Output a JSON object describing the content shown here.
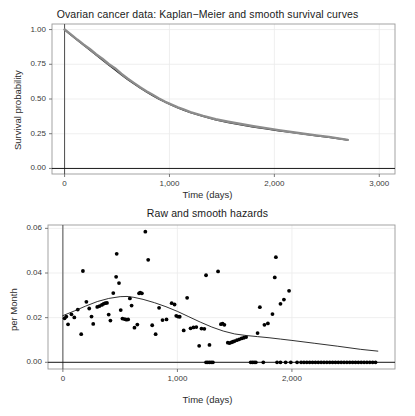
{
  "figure": {
    "width": 415,
    "height": 416,
    "background": "#ffffff",
    "panel_background": "#ffffff",
    "grid_color": "#ebebeb",
    "axis_color": "#4d4d4d",
    "point_color": "#000000",
    "smooth_curve_color": "#1a1a1a",
    "km_curve_color": "#8c8c8c"
  },
  "chart_data": [
    {
      "id": "survival",
      "type": "line",
      "title": "Ovarian cancer data: Kaplan−Meier and smooth survival curves",
      "xlabel": "Time (days)",
      "ylabel": "Survival probability",
      "xlim": [
        -120,
        3150
      ],
      "ylim": [
        -0.04,
        1.04
      ],
      "xticks": [
        0,
        1000,
        2000,
        3000
      ],
      "xticklabels": [
        "0",
        "1,000",
        "2,000",
        "3,000"
      ],
      "yticks": [
        0.0,
        0.25,
        0.5,
        0.75,
        1.0
      ],
      "yticklabels": [
        "0.00",
        "0.25",
        "0.50",
        "0.75",
        "1.00"
      ],
      "grid": true,
      "legend": "none",
      "series": [
        {
          "name": "Smooth survival curve",
          "style": "solid-dark",
          "x": [
            0,
            60,
            120,
            180,
            240,
            300,
            360,
            420,
            480,
            540,
            600,
            660,
            720,
            780,
            840,
            900,
            960,
            1020,
            1080,
            1140,
            1200,
            1320,
            1440,
            1560,
            1680,
            1800,
            1920,
            2040,
            2160,
            2280,
            2400,
            2520,
            2700
          ],
          "y": [
            1.0,
            0.962,
            0.925,
            0.889,
            0.854,
            0.818,
            0.782,
            0.746,
            0.711,
            0.676,
            0.642,
            0.61,
            0.58,
            0.552,
            0.525,
            0.5,
            0.477,
            0.456,
            0.437,
            0.419,
            0.403,
            0.375,
            0.351,
            0.331,
            0.314,
            0.299,
            0.285,
            0.272,
            0.26,
            0.248,
            0.236,
            0.225,
            0.205
          ]
        },
        {
          "name": "Kaplan−Meier step curve",
          "style": "solid-grey",
          "x": [
            0,
            60,
            120,
            180,
            240,
            300,
            360,
            420,
            480,
            540,
            600,
            660,
            720,
            780,
            840,
            900,
            960,
            1020,
            1080,
            1140,
            1200,
            1320,
            1440,
            1560,
            1680,
            1800,
            1920,
            2040,
            2160,
            2280,
            2400,
            2520,
            2700
          ],
          "y": [
            1.0,
            0.965,
            0.928,
            0.893,
            0.86,
            0.822,
            0.79,
            0.752,
            0.722,
            0.682,
            0.648,
            0.616,
            0.584,
            0.556,
            0.53,
            0.504,
            0.48,
            0.46,
            0.44,
            0.423,
            0.406,
            0.378,
            0.354,
            0.336,
            0.32,
            0.304,
            0.29,
            0.276,
            0.262,
            0.25,
            0.238,
            0.227,
            0.206
          ]
        }
      ]
    },
    {
      "id": "hazard",
      "type": "scatter",
      "title": "Raw and smooth hazards",
      "xlabel": "Time (days)",
      "ylabel": "per Month",
      "xlim": [
        -130,
        2900
      ],
      "ylim": [
        -0.003,
        0.0615
      ],
      "xticks": [
        0,
        1000,
        2000
      ],
      "xticklabels": [
        "0",
        "1,000",
        "2,000"
      ],
      "yticks": [
        0.0,
        0.02,
        0.04,
        0.06
      ],
      "yticklabels": [
        "0.00",
        "0.02",
        "0.04",
        "0.06"
      ],
      "grid": true,
      "legend": "none",
      "points": [
        [
          15,
          0.0197
        ],
        [
          30,
          0.0205
        ],
        [
          45,
          0.017
        ],
        [
          75,
          0.0215
        ],
        [
          100,
          0.0201
        ],
        [
          130,
          0.0236
        ],
        [
          160,
          0.0126
        ],
        [
          175,
          0.0409
        ],
        [
          205,
          0.0271
        ],
        [
          230,
          0.0241
        ],
        [
          250,
          0.0205
        ],
        [
          265,
          0.0172
        ],
        [
          300,
          0.0248
        ],
        [
          320,
          0.0252
        ],
        [
          340,
          0.0257
        ],
        [
          355,
          0.0262
        ],
        [
          370,
          0.0265
        ],
        [
          385,
          0.0266
        ],
        [
          400,
          0.0214
        ],
        [
          415,
          0.0187
        ],
        [
          440,
          0.031
        ],
        [
          465,
          0.0383
        ],
        [
          470,
          0.0486
        ],
        [
          490,
          0.0355
        ],
        [
          505,
          0.0234
        ],
        [
          520,
          0.0196
        ],
        [
          540,
          0.0193
        ],
        [
          555,
          0.0191
        ],
        [
          570,
          0.0192
        ],
        [
          585,
          0.0286
        ],
        [
          600,
          0.0254
        ],
        [
          625,
          0.0155
        ],
        [
          650,
          0.0169
        ],
        [
          665,
          0.0309
        ],
        [
          675,
          0.0312
        ],
        [
          690,
          0.0309
        ],
        [
          720,
          0.0585
        ],
        [
          745,
          0.0459
        ],
        [
          780,
          0.0166
        ],
        [
          810,
          0.0126
        ],
        [
          840,
          0.0244
        ],
        [
          870,
          0.0189
        ],
        [
          905,
          0.0192
        ],
        [
          950,
          0.0265
        ],
        [
          975,
          0.0259
        ],
        [
          990,
          0.0208
        ],
        [
          1005,
          0.0205
        ],
        [
          1020,
          0.0204
        ],
        [
          1055,
          0.0143
        ],
        [
          1085,
          0.0289
        ],
        [
          1115,
          0.0152
        ],
        [
          1140,
          0.0156
        ],
        [
          1165,
          0.0158
        ],
        [
          1190,
          0.0074
        ],
        [
          1210,
          0.0151
        ],
        [
          1235,
          0.015
        ],
        [
          1250,
          0.039
        ],
        [
          1280,
          0.0078
        ],
        [
          1355,
          0.0407
        ],
        [
          1380,
          0.0171
        ],
        [
          1395,
          0.0173
        ],
        [
          1410,
          0.0168
        ],
        [
          1440,
          0.0088
        ],
        [
          1455,
          0.0086
        ],
        [
          1470,
          0.0089
        ],
        [
          1485,
          0.0092
        ],
        [
          1500,
          0.0095
        ],
        [
          1520,
          0.0099
        ],
        [
          1540,
          0.0103
        ],
        [
          1560,
          0.0107
        ],
        [
          1580,
          0.011
        ],
        [
          1600,
          0.0113
        ],
        [
          1700,
          0.0131
        ],
        [
          1720,
          0.0247
        ],
        [
          1760,
          0.0168
        ],
        [
          1790,
          0.0174
        ],
        [
          1830,
          0.0216
        ],
        [
          1850,
          0.038
        ],
        [
          1860,
          0.0471
        ],
        [
          1900,
          0.0262
        ],
        [
          1930,
          0.0281
        ],
        [
          1975,
          0.032
        ],
        [
          1250,
          0.0
        ],
        [
          1265,
          0.0
        ],
        [
          1280,
          0.0
        ],
        [
          1295,
          0.0
        ],
        [
          1310,
          0.0
        ],
        [
          1640,
          0.0
        ],
        [
          1655,
          0.0
        ],
        [
          1670,
          0.0
        ],
        [
          1685,
          0.0
        ],
        [
          1750,
          0.0
        ],
        [
          1870,
          0.0
        ],
        [
          1900,
          0.0
        ],
        [
          1945,
          0.0
        ],
        [
          1990,
          0.0
        ],
        [
          2045,
          0.0
        ],
        [
          2080,
          0.0
        ],
        [
          2105,
          0.0
        ],
        [
          2130,
          0.0
        ],
        [
          2155,
          0.0
        ],
        [
          2180,
          0.0
        ],
        [
          2205,
          0.0
        ],
        [
          2230,
          0.0
        ],
        [
          2255,
          0.0
        ],
        [
          2280,
          0.0
        ],
        [
          2305,
          0.0
        ],
        [
          2330,
          0.0
        ],
        [
          2355,
          0.0
        ],
        [
          2380,
          0.0
        ],
        [
          2405,
          0.0
        ],
        [
          2430,
          0.0
        ],
        [
          2455,
          0.0
        ],
        [
          2480,
          0.0
        ],
        [
          2505,
          0.0
        ],
        [
          2530,
          0.0
        ],
        [
          2555,
          0.0
        ],
        [
          2580,
          0.0
        ],
        [
          2605,
          0.0
        ],
        [
          2630,
          0.0
        ],
        [
          2655,
          0.0
        ],
        [
          2680,
          0.0
        ],
        [
          2705,
          0.0
        ],
        [
          2730,
          0.0
        ]
      ],
      "smooth_line": {
        "name": "Smooth hazard",
        "style": "solid-dark",
        "x": [
          0,
          100,
          200,
          300,
          400,
          500,
          560,
          620,
          700,
          800,
          900,
          1000,
          1100,
          1200,
          1300,
          1400,
          1500,
          1600,
          1700,
          1800,
          1900,
          2000,
          2200,
          2400,
          2600,
          2750
        ],
        "y": [
          0.0209,
          0.023,
          0.0252,
          0.0272,
          0.0286,
          0.0294,
          0.0295,
          0.0291,
          0.0282,
          0.0267,
          0.0249,
          0.0228,
          0.0204,
          0.018,
          0.0158,
          0.014,
          0.0127,
          0.012,
          0.0115,
          0.011,
          0.0104,
          0.0098,
          0.0085,
          0.0072,
          0.0058,
          0.005
        ]
      }
    }
  ]
}
